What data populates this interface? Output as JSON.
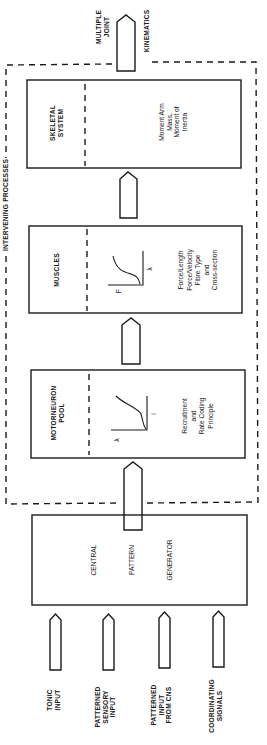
{
  "diagram": {
    "outer_group_label": "INTERVENING PROCESSES",
    "output": {
      "line1": "MULTIPLE",
      "line2": "JOINT",
      "line3": "KINEMATICS"
    },
    "blocks": [
      {
        "id": "skeletal",
        "title_line1": "SKELETAL",
        "title_line2": "SYSTEM",
        "props": [
          "Moment Arm",
          "Mass,",
          "Moment of",
          "Inertia"
        ]
      },
      {
        "id": "muscles",
        "title_line1": "MUSCLES",
        "graph": {
          "x_label": "λ",
          "y_label": "F",
          "curve": "sigmoid"
        },
        "props": [
          "Force/Length",
          "Force/Velocity",
          "Fibre Type",
          "and",
          "Cross-section"
        ]
      },
      {
        "id": "motorneuron",
        "title_line1": "MOTORNEURON",
        "title_line2": "POOL",
        "graph": {
          "x_label": "i",
          "y_label": "λ",
          "curve": "recruitment"
        },
        "props": [
          "Recruitment",
          "and",
          "Rate Coding",
          "Principle"
        ]
      }
    ],
    "generator": {
      "line1": "CENTRAL",
      "line2": "PATTERN",
      "line3": "GENERATOR"
    },
    "inputs": [
      {
        "lines": [
          "TONIC",
          "INPUT"
        ]
      },
      {
        "lines": [
          "PATTERNED",
          "SENSORY",
          "INPUT"
        ]
      },
      {
        "lines": [
          "PATTERNED",
          "INPUT",
          "FROM CNS"
        ]
      },
      {
        "lines": [
          "COORDINATING",
          "SIGNALS"
        ]
      }
    ],
    "colors": {
      "ink": "#1a1a1a",
      "background": "#ffffff"
    }
  }
}
